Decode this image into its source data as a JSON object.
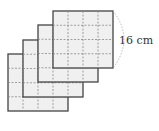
{
  "figure": {
    "sheet_count": 4,
    "grid": "4x4",
    "dimension_label": "16 cm",
    "colors": {
      "fill": "#f0f0f0",
      "border": "#444444",
      "grid": "#888888",
      "arc": "#aaaaaa"
    }
  }
}
